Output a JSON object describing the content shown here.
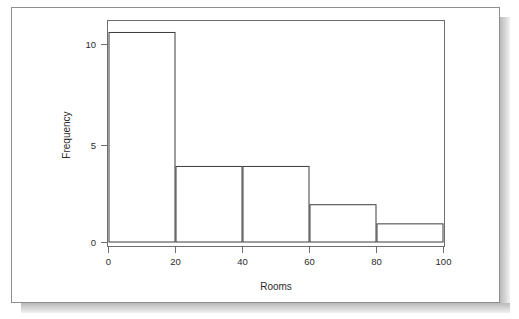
{
  "figure": {
    "background_color": "#ffffff",
    "card_border_color": "#8e8e8e",
    "shadow_color": "#b9b9b9"
  },
  "chart_data": {
    "type": "bar",
    "subtype": "histogram",
    "title": "",
    "subtitle": "",
    "xlabel": "Rooms",
    "ylabel": "Frequency",
    "categories": [
      "0-20",
      "20-40",
      "40-60",
      "60-80",
      "80-100"
    ],
    "bin_edges": [
      0,
      20,
      40,
      60,
      80,
      100
    ],
    "values": [
      11,
      4,
      4,
      2,
      1
    ],
    "bin_width": 20,
    "xlim": [
      0,
      100
    ],
    "ylim": [
      0,
      11.6
    ],
    "xticks": [
      0,
      20,
      40,
      60,
      80,
      100
    ],
    "yticks": [
      0,
      5,
      10
    ],
    "xtick_labels": [
      "0",
      "20",
      "40",
      "60",
      "80",
      "100"
    ],
    "ytick_labels": [
      "0",
      "5",
      "10"
    ],
    "grid": false,
    "legend": null,
    "legend_position": "none",
    "bar_fill": "#ffffff",
    "bar_stroke": "#3c3c3c",
    "axis_color": "#5a5a5a",
    "frame": true,
    "annotations": []
  },
  "axes": {
    "x": {
      "title": "Rooms",
      "ticks": [
        {
          "value": 0,
          "label": "0"
        },
        {
          "value": 20,
          "label": "20"
        },
        {
          "value": 40,
          "label": "40"
        },
        {
          "value": 60,
          "label": "60"
        },
        {
          "value": 80,
          "label": "80"
        },
        {
          "value": 100,
          "label": "100"
        }
      ]
    },
    "y": {
      "title": "Frequency",
      "ticks": [
        {
          "value": 0,
          "label": "0"
        },
        {
          "value": 5,
          "label": "5"
        },
        {
          "value": 10,
          "label": "10"
        }
      ]
    }
  }
}
